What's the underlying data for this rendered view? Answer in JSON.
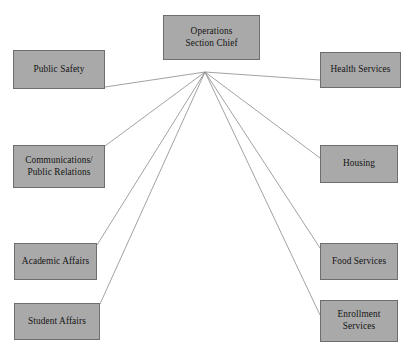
{
  "diagram": {
    "type": "hub-and-spoke organizational chart",
    "background_color": "#ffffff",
    "node_fill_color": "#a9a9a9",
    "node_border_color": "#6e6e6e",
    "connector_color": "#8a8a8a",
    "hub": {
      "x": 205,
      "y": 72
    },
    "root": {
      "label": "Operations\nSection Chief"
    },
    "nodes": [
      {
        "key": "public-safety",
        "label": "Public Safety",
        "side": "left",
        "connect_x": 105,
        "connect_y": 87
      },
      {
        "key": "communications",
        "label": "Communications/\nPublic Relations",
        "side": "left",
        "connect_x": 105,
        "connect_y": 146
      },
      {
        "key": "academic",
        "label": "Academic Affairs",
        "side": "left",
        "connect_x": 97,
        "connect_y": 245
      },
      {
        "key": "student",
        "label": "Student Affairs",
        "side": "left",
        "connect_x": 100,
        "connect_y": 304
      },
      {
        "key": "health",
        "label": "Health Services",
        "side": "right",
        "connect_x": 320,
        "connect_y": 80
      },
      {
        "key": "housing",
        "label": "Housing",
        "side": "right",
        "connect_x": 320,
        "connect_y": 158
      },
      {
        "key": "food",
        "label": "Food Services",
        "side": "right",
        "connect_x": 320,
        "connect_y": 248
      },
      {
        "key": "enrollment",
        "label": "Enrollment\nServices",
        "side": "right",
        "connect_x": 320,
        "connect_y": 315
      }
    ]
  }
}
